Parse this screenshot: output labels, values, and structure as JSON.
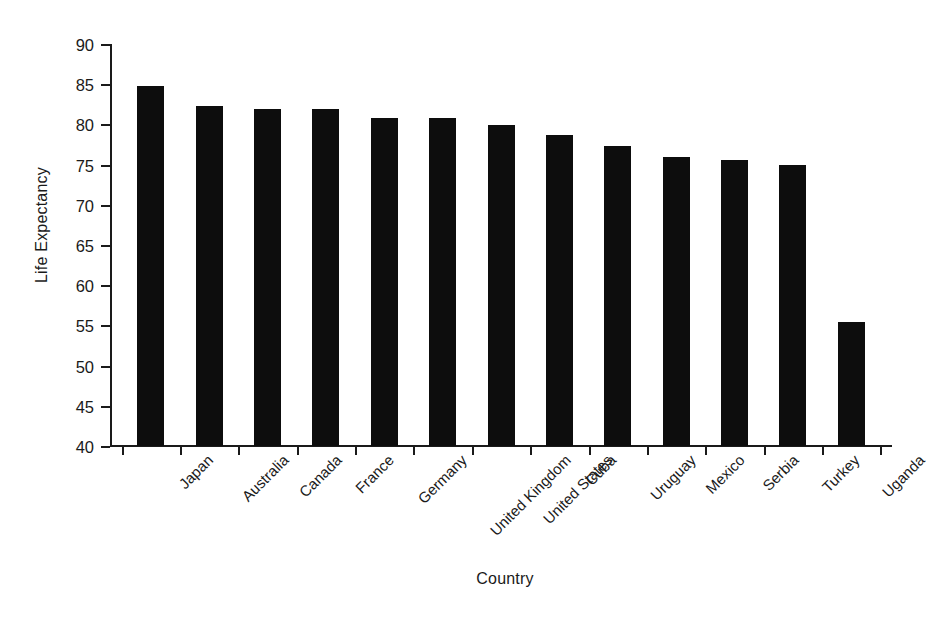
{
  "chart_data": {
    "type": "bar",
    "title": "",
    "xlabel": "Country",
    "ylabel": "Life Expectancy",
    "categories": [
      "Japan",
      "Australia",
      "Canada",
      "France",
      "Germany",
      "United Kingdom",
      "United States",
      "Cuba",
      "Uruguay",
      "Mexico",
      "Serbia",
      "Turkey",
      "Uganda"
    ],
    "values": [
      84.8,
      82.3,
      81.9,
      81.9,
      80.8,
      80.8,
      79.9,
      78.7,
      77.3,
      75.9,
      75.6,
      74.9,
      55.4
    ],
    "ylim": [
      40,
      90
    ],
    "yticks": [
      40,
      45,
      50,
      55,
      60,
      65,
      70,
      75,
      80,
      85,
      90
    ],
    "ytick_labels": [
      "40",
      "45",
      "50",
      "55",
      "60",
      "65",
      "70",
      "75",
      "80",
      "85",
      "90"
    ],
    "grid": false,
    "legend": null,
    "bar_color": "#0d0d0d",
    "axis_color": "#1a1a1a",
    "background": "#ffffff"
  }
}
